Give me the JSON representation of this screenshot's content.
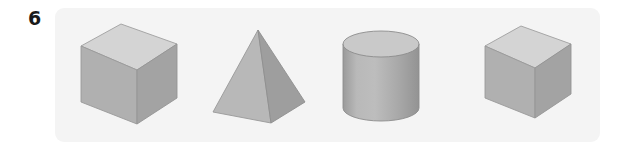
{
  "exercise": {
    "number": "6"
  },
  "panel": {
    "background_color": "#f4f4f4",
    "corner_radius_px": 9
  },
  "page": {
    "background_color": "#ffffff"
  },
  "shapes": [
    {
      "id": "cube-1",
      "name": "cube",
      "label": "Cube",
      "faces": {
        "top": "#d4d4d4",
        "front": "#b0b0b0",
        "side": "#a3a3a3"
      },
      "edge_color": "#9a9a9a"
    },
    {
      "id": "pyramid",
      "name": "square-pyramid",
      "label": "Square pyramid",
      "faces": {
        "left": "#b8b8b8",
        "right": "#9e9e9e"
      },
      "edge_color": "#8f8f8f"
    },
    {
      "id": "cylinder",
      "name": "cylinder",
      "label": "Cylinder",
      "faces": {
        "top": "#c9c9c9",
        "body_light": "#bdbdbd",
        "body_mid": "#ababab",
        "body_dark": "#959595"
      },
      "edge_color": "#8c8c8c"
    },
    {
      "id": "cube-2",
      "name": "cube",
      "label": "Cube",
      "faces": {
        "top": "#d4d4d4",
        "front": "#b0b0b0",
        "side": "#a3a3a3"
      },
      "edge_color": "#9a9a9a"
    }
  ]
}
